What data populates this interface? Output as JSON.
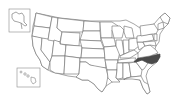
{
  "map": {
    "title": "",
    "region": "United States",
    "highlighted_state": "North Carolina",
    "highlight_color": "#4a4a4a",
    "base_fill": "#ffffff",
    "border_color": "#6a6a6a",
    "insets": [
      "Alaska",
      "Hawaii"
    ]
  }
}
